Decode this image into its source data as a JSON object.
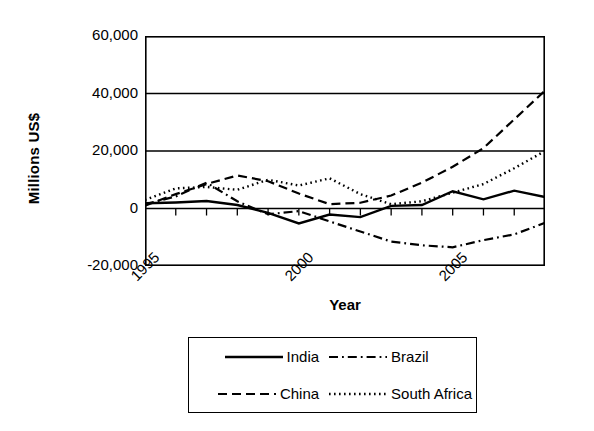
{
  "chart_data": {
    "type": "line",
    "title": "",
    "xlabel": "Year",
    "ylabel": "Millions US$",
    "xlim": [
      1995,
      2008
    ],
    "ylim": [
      -20000,
      60000
    ],
    "grid": true,
    "legend_position": "bottom",
    "x": [
      1995,
      1996,
      1997,
      1998,
      1999,
      2000,
      2001,
      2002,
      2003,
      2004,
      2005,
      2006,
      2007,
      2008
    ],
    "yticks": [
      60000,
      40000,
      20000,
      0,
      -20000
    ],
    "ytick_labels": [
      "60,000",
      "40,000",
      "20,000",
      "0",
      "-20,000"
    ],
    "xticks": [
      1995,
      2000,
      2005
    ],
    "xtick_labels": [
      "1995",
      "2000",
      "2005"
    ],
    "series": [
      {
        "name": "India",
        "style": "solid",
        "values": [
          1800,
          2100,
          2600,
          1200,
          -1500,
          -5200,
          -2100,
          -3000,
          900,
          1200,
          6000,
          3200,
          6200,
          4000
        ]
      },
      {
        "name": "Brazil",
        "style": "dash-dot",
        "values": [
          1500,
          4200,
          9000,
          2500,
          -2000,
          -900,
          -4500,
          -8000,
          -11500,
          -12800,
          -13500,
          -11000,
          -9000,
          -5000
        ]
      },
      {
        "name": "China",
        "style": "dashed",
        "values": [
          1000,
          5000,
          8500,
          11500,
          9500,
          5200,
          1500,
          2000,
          4500,
          9000,
          14500,
          21000,
          31000,
          41000
        ]
      },
      {
        "name": "South Africa",
        "style": "dotted",
        "values": [
          3000,
          7000,
          7500,
          6500,
          10000,
          8000,
          10500,
          5000,
          1500,
          2500,
          5500,
          8500,
          14000,
          20000
        ]
      }
    ]
  },
  "axis": {
    "ylabel": "Millions US$",
    "xlabel": "Year"
  },
  "legend": {
    "items": [
      {
        "label": "India",
        "style": "solid"
      },
      {
        "label": "Brazil",
        "style": "dash-dot"
      },
      {
        "label": "China",
        "style": "dashed"
      },
      {
        "label": "South Africa",
        "style": "dotted"
      }
    ]
  },
  "colors": {
    "line": "#000000",
    "axis": "#000000",
    "background": "#ffffff"
  }
}
